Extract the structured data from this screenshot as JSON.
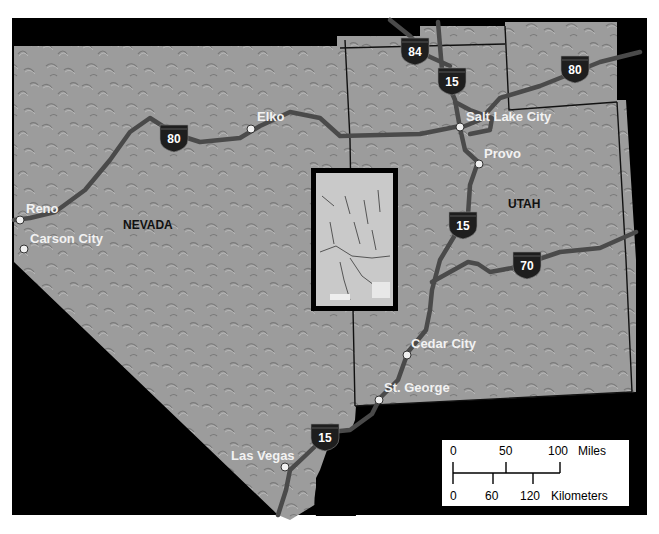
{
  "map": {
    "colors": {
      "background": "#000000",
      "terrain": "#9a9a9a",
      "road": "#4a4a4a",
      "shield": "#1e1e1e",
      "city_dot": "#f0f0f0",
      "state_border": "#111111"
    },
    "states": [
      {
        "name": "NEVADA"
      },
      {
        "name": "UTAH"
      }
    ],
    "cities": [
      {
        "name": "Reno"
      },
      {
        "name": "Carson City"
      },
      {
        "name": "Elko"
      },
      {
        "name": "Salt Lake City"
      },
      {
        "name": "Provo"
      },
      {
        "name": "Cedar City"
      },
      {
        "name": "St. George"
      },
      {
        "name": "Las Vegas"
      }
    ],
    "interstate_shields": [
      {
        "number": "80",
        "note": "Nevada I-80 near Elko"
      },
      {
        "number": "84"
      },
      {
        "number": "15",
        "note": "north of Salt Lake City"
      },
      {
        "number": "80",
        "note": "Wyoming I-80"
      },
      {
        "number": "15",
        "note": "south of Provo"
      },
      {
        "number": "70"
      },
      {
        "number": "15",
        "note": "near Las Vegas"
      }
    ],
    "inset": {
      "label": "study-area-inset-map"
    },
    "scale_bar": {
      "miles_ticks": [
        "0",
        "50",
        "100"
      ],
      "miles_unit": "Miles",
      "km_ticks": [
        "0",
        "60",
        "120"
      ],
      "km_unit": "Kilometers"
    }
  }
}
